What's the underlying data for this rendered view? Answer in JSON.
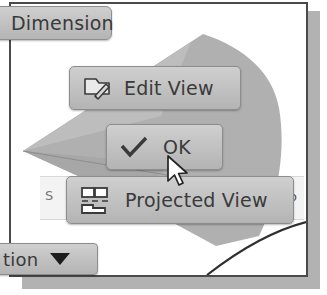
{
  "app": {
    "context": "cad-drawing-context-menu",
    "background_color": "#ffffff",
    "frame_border_color": "#4a4a4a",
    "button_face_color": "#c2c2c2",
    "geometry_fill_color": "#b0b0b0",
    "text_color": "#3a3a3a"
  },
  "toolbar": {
    "dimension_label": "Dimension"
  },
  "context_menu": {
    "items": [
      {
        "label": "Edit View",
        "icon": "edit-view-icon"
      },
      {
        "label": "OK",
        "icon": "checkmark-icon"
      },
      {
        "label": "Projected View",
        "icon": "projected-view-icon"
      }
    ]
  },
  "field": {
    "left_text": "S",
    "right_text": "o"
  },
  "status_bar": {
    "selection_label": "tion",
    "caret_icon": "chevron-down-icon"
  },
  "cursor": {
    "icon": "mouse-pointer-icon",
    "x": 154,
    "y": 150
  }
}
